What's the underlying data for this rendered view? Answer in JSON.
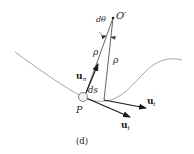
{
  "figure": {
    "caption": "(d)",
    "labels": {
      "center": "O′",
      "dtheta": "dθ",
      "rho_left": "ρ",
      "rho_right": "ρ",
      "point": "P",
      "ds": "ds",
      "un_base": "u",
      "un_sub": "n",
      "ut_base": "u",
      "ut_sub": "t",
      "utp_base": "u",
      "utp_sub": "t",
      "utp_prime": "′"
    },
    "colors": {
      "curve": "#9a9a9a",
      "line": "#555555",
      "arrow": "#1a1a1a",
      "text": "#222222"
    }
  }
}
